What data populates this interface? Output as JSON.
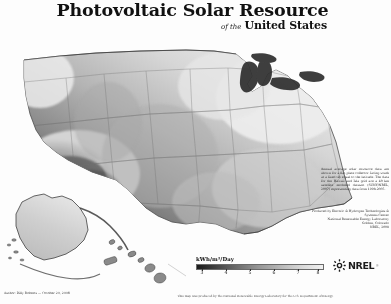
{
  "poster": {
    "title": "Photovoltaic Solar Resource",
    "subtitle_prefix": "of the",
    "subtitle": "United States",
    "background_color": "#fdfdfc",
    "rendering": "grayscale"
  },
  "legend": {
    "title": "kWh/m²/Day",
    "unit": "kWh/m²/Day",
    "ticks": [
      "3",
      "4",
      "5",
      "6",
      "7",
      "8"
    ],
    "min": 3,
    "max": 8,
    "gradient_dark_hex": "#1b1b1b",
    "gradient_light_hex": "#f1f1f1"
  },
  "notes": {
    "main": "Annual average solar resource data are shown for a flat plate collector facing south at a fixed tilt equal to the latitude. The data for the Hawaii and Isla grid are a 40 km satellite modeled dataset (SUNY/NREL, 2007) representing data from 1998-2005.",
    "credit_lines": [
      "Produced by Electric & Hydrogen Technologies & Systems Center",
      "National Renewable Energy Laboratory",
      "Golden, Colorado",
      "NREL, 2008"
    ]
  },
  "caption_bottom_left": "Author: Billy Roberts  —  October 20, 2008",
  "disclaimer": "This map was produced by the National Renewable Energy Laboratory for the U.S. Department of Energy.",
  "logo": {
    "name": "NREL",
    "wordmark": "NREL",
    "trademark": "®",
    "icon": "nrel-sunburst-icon"
  },
  "map": {
    "regions": [
      "Continental United States",
      "Alaska",
      "Hawaii"
    ],
    "projection_note": "Alaska and Hawaii shown as insets at lower left"
  }
}
